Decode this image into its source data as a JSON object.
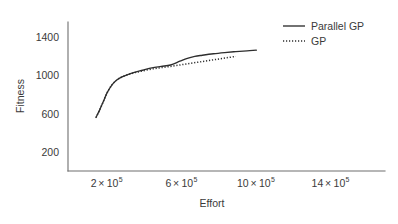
{
  "chart_data": {
    "type": "line",
    "title": "",
    "xlabel": "Effort",
    "ylabel": "Fitness",
    "xlim": [
      0,
      1700000
    ],
    "ylim": [
      0,
      1560
    ],
    "grid": false,
    "legend_position": "top-right",
    "xticks": [
      {
        "value": 200000,
        "label": "2",
        "multiplier": "×",
        "base": "10",
        "exponent": "5"
      },
      {
        "value": 600000,
        "label": "6",
        "multiplier": "×",
        "base": "10",
        "exponent": "5"
      },
      {
        "value": 1000000,
        "label": "10",
        "multiplier": "×",
        "base": "10",
        "exponent": "5"
      },
      {
        "value": 1400000,
        "label": "14",
        "multiplier": "×",
        "base": "10",
        "exponent": "5"
      }
    ],
    "yticks": [
      {
        "value": 200,
        "label": "200"
      },
      {
        "value": 600,
        "label": "600"
      },
      {
        "value": 1000,
        "label": "1000"
      },
      {
        "value": 1400,
        "label": "1400"
      }
    ],
    "series": [
      {
        "name": "Parallel GP",
        "style": "solid",
        "color": "#2e2e2e",
        "x": [
          150000,
          170000,
          190000,
          210000,
          235000,
          260000,
          290000,
          320000,
          360000,
          400000,
          450000,
          500000,
          550000,
          600000,
          640000,
          680000,
          720000,
          780000,
          840000,
          900000,
          960000,
          1010000
        ],
        "y": [
          560,
          640,
          730,
          820,
          900,
          950,
          985,
          1010,
          1035,
          1055,
          1080,
          1095,
          1110,
          1150,
          1180,
          1200,
          1212,
          1228,
          1240,
          1250,
          1258,
          1265
        ]
      },
      {
        "name": "GP",
        "style": "dotted",
        "color": "#2e2e2e",
        "x": [
          150000,
          170000,
          190000,
          210000,
          235000,
          260000,
          290000,
          320000,
          360000,
          400000,
          450000,
          500000,
          550000,
          600000,
          650000,
          700000,
          750000,
          800000,
          850000,
          900000
        ],
        "y": [
          560,
          640,
          730,
          820,
          900,
          950,
          985,
          1008,
          1030,
          1048,
          1068,
          1082,
          1095,
          1110,
          1125,
          1140,
          1155,
          1170,
          1185,
          1200
        ]
      }
    ]
  },
  "legend": {
    "items": [
      {
        "label": "Parallel GP",
        "style": "solid"
      },
      {
        "label": "GP",
        "style": "dotted"
      }
    ]
  },
  "axes": {
    "y_title": "Fitness",
    "x_title": "Effort"
  }
}
